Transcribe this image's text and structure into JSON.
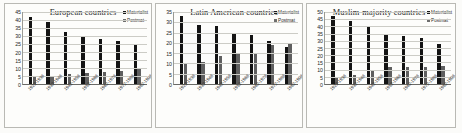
{
  "chart_data": [
    {
      "type": "bar",
      "title": "European countries",
      "categories": [
        "1922-1936",
        "1932-1946",
        "1942-1956",
        "1952-1966",
        "1962-1976",
        "1972-1986",
        "1982-1996"
      ],
      "series": [
        {
          "name": "Materialist",
          "values": [
            42,
            39,
            32.5,
            30,
            28,
            27,
            25
          ],
          "color": "#141414"
        },
        {
          "name": "Postmat",
          "values": [
            5,
            5,
            6,
            7,
            7.5,
            8,
            10
          ],
          "color": "#5f5f5f"
        }
      ],
      "yticks": [
        45,
        40,
        35,
        30,
        25,
        20,
        15,
        10,
        5,
        0
      ],
      "ylim": [
        0,
        45
      ],
      "xlabel": "",
      "ylabel": "",
      "grid": true,
      "legend_position": "top-right"
    },
    {
      "type": "bar",
      "title": "Latin American countries",
      "categories": [
        "1922-1936",
        "1932-1946",
        "1942-1956",
        "1952-1966",
        "1962-1976",
        "1972-1986",
        "1982-1996"
      ],
      "series": [
        {
          "name": "Materialist",
          "values": [
            33,
            28.5,
            28,
            25,
            24,
            21,
            18
          ],
          "color": "#141414"
        },
        {
          "name": "Postmat",
          "values": [
            10,
            10.5,
            13.5,
            15,
            15,
            19,
            20
          ],
          "color": "#5f5f5f"
        }
      ],
      "yticks": [
        35,
        30,
        25,
        20,
        15,
        10,
        5,
        0
      ],
      "ylim": [
        0,
        35
      ],
      "xlabel": "",
      "ylabel": "",
      "grid": true,
      "legend_position": "top-right"
    },
    {
      "type": "bar",
      "title": "Muslim-majority countries",
      "categories": [
        "1922-1936",
        "1932-1946",
        "1942-1956",
        "1952-1966",
        "1962-1976",
        "1972-1986",
        "1982-1996"
      ],
      "series": [
        {
          "name": "Materialist",
          "values": [
            47,
            44,
            40,
            35,
            33,
            32,
            28
          ],
          "color": "#141414"
        },
        {
          "name": "Postmat",
          "values": [
            4,
            6.5,
            9,
            11.5,
            11.5,
            11.5,
            12.5
          ],
          "color": "#5f5f5f"
        }
      ],
      "yticks": [
        50,
        45,
        40,
        35,
        30,
        25,
        20,
        15,
        10,
        5,
        0
      ],
      "ylim": [
        0,
        50
      ],
      "xlabel": "",
      "ylabel": "",
      "grid": true,
      "legend_position": "top-right"
    }
  ]
}
